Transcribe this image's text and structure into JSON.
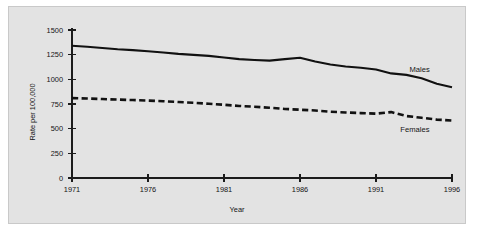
{
  "chart_data": {
    "type": "line",
    "title": "",
    "xlabel": "Year",
    "ylabel": "Rate per 100,000",
    "xlim": [
      1971,
      1996
    ],
    "ylim": [
      0,
      1500
    ],
    "grid": false,
    "legend_position": "inline-right",
    "x_ticks": [
      "1971",
      "1976",
      "1981",
      "1986",
      "1991",
      "1996"
    ],
    "y_ticks": [
      "0",
      "250",
      "500",
      "750",
      "1000",
      "1250",
      "1500"
    ],
    "x": [
      1971,
      1972,
      1973,
      1974,
      1975,
      1976,
      1977,
      1978,
      1979,
      1980,
      1981,
      1982,
      1983,
      1984,
      1985,
      1986,
      1987,
      1988,
      1989,
      1990,
      1991,
      1992,
      1993,
      1994,
      1995,
      1996
    ],
    "series": [
      {
        "name": "Males",
        "style": "solid",
        "values": [
          1340,
          1330,
          1318,
          1305,
          1296,
          1285,
          1272,
          1258,
          1248,
          1238,
          1222,
          1205,
          1196,
          1190,
          1205,
          1218,
          1180,
          1150,
          1130,
          1118,
          1100,
          1060,
          1045,
          1010,
          955,
          920
        ]
      },
      {
        "name": "Females",
        "style": "dashed",
        "values": [
          810,
          806,
          800,
          795,
          790,
          785,
          778,
          770,
          762,
          752,
          742,
          730,
          722,
          712,
          700,
          692,
          684,
          672,
          664,
          658,
          652,
          668,
          628,
          610,
          592,
          582
        ]
      }
    ],
    "annotations": [
      {
        "text": "Males",
        "x": 1993.2,
        "y": 1072
      },
      {
        "text": "Females",
        "x": 1992.6,
        "y": 468
      }
    ],
    "colors": {
      "line": "#111111",
      "axis": "#1c1c1c",
      "panel_background": "#e3e3e3",
      "panel_border": "#c9c9c9",
      "page_background": "#ffffff"
    }
  }
}
